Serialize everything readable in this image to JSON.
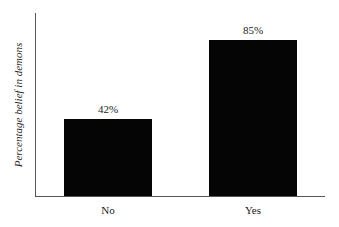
{
  "chart_data": {
    "type": "bar",
    "title": "",
    "xlabel": "",
    "ylabel": "Percentage belief in demons",
    "categories": [
      "No",
      "Yes"
    ],
    "values": [
      42,
      85
    ],
    "value_labels": [
      "42%",
      "85%"
    ],
    "ylim": [
      0,
      100
    ],
    "grid": false,
    "legend": null,
    "bar_color": "#050505",
    "axis_color": "#555555"
  }
}
